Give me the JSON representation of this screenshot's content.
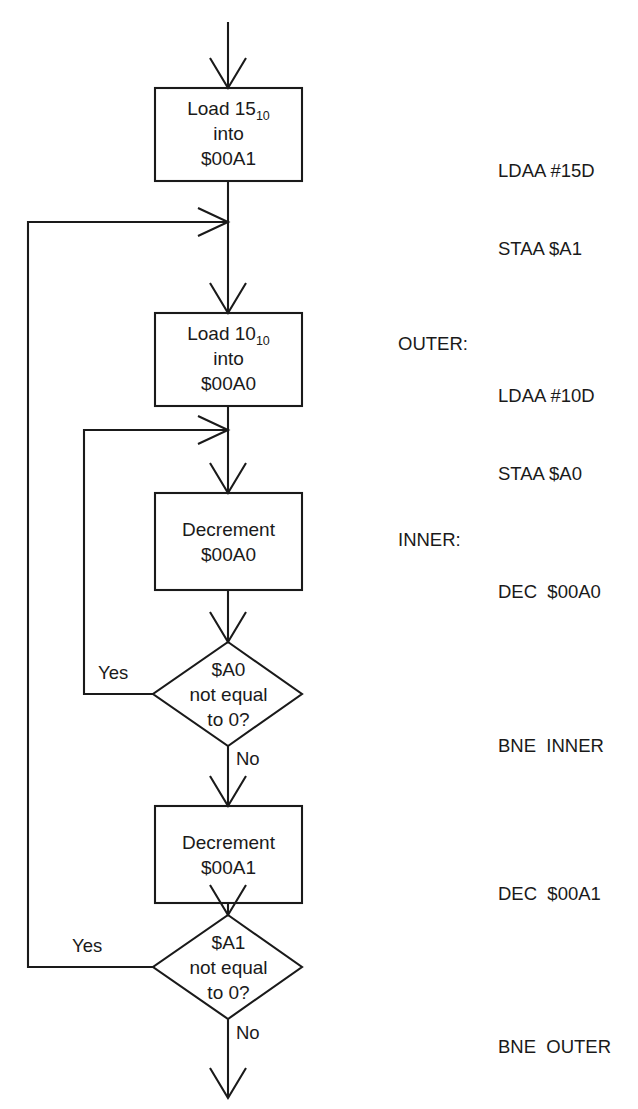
{
  "diagram": {
    "stroke_color": "#1a1a1a",
    "background_color": "#ffffff"
  },
  "nodes": [
    {
      "id": "load-a1",
      "type": "process",
      "line1_pre": "Load 15",
      "line1_sub": "10",
      "line2": "into",
      "line3": "$00A1"
    },
    {
      "id": "load-a0",
      "type": "process",
      "line1_pre": "Load 10",
      "line1_sub": "10",
      "line2": "into",
      "line3": "$00A0"
    },
    {
      "id": "dec-a0",
      "type": "process",
      "line1": "Decrement",
      "line2": "$00A0"
    },
    {
      "id": "test-a0",
      "type": "decision",
      "line1": "$A0",
      "line2": "not equal",
      "line3": "to 0?"
    },
    {
      "id": "dec-a1",
      "type": "process",
      "line1": "Decrement",
      "line2": "$00A1"
    },
    {
      "id": "test-a1",
      "type": "decision",
      "line1": "$A1",
      "line2": "not equal",
      "line3": "to 0?"
    }
  ],
  "edge_labels": {
    "inner_yes": "Yes",
    "inner_no": "No",
    "outer_yes": "Yes",
    "outer_no": "No"
  },
  "annotations": [
    {
      "id": "ann-1",
      "label": "",
      "line1": "LDAA #15D",
      "line2": "STAA $A1"
    },
    {
      "id": "ann-2",
      "label": "OUTER:",
      "line1": "LDAA #10D",
      "line2": "STAA $A0"
    },
    {
      "id": "ann-3",
      "label": "INNER:",
      "line1": "DEC  $00A0",
      "line2": ""
    },
    {
      "id": "ann-4",
      "label": "",
      "line1": "BNE  INNER",
      "line2": ""
    },
    {
      "id": "ann-5",
      "label": "",
      "line1": "DEC  $00A1",
      "line2": ""
    },
    {
      "id": "ann-6",
      "label": "",
      "line1": "BNE  OUTER",
      "line2": ""
    }
  ]
}
